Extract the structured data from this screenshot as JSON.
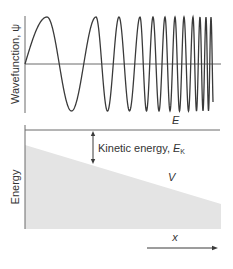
{
  "colors": {
    "line": "#3a3a3a",
    "axis": "#6a6a6a",
    "fill": "#e4e4e4",
    "text": "#333333",
    "background": "#ffffff"
  },
  "top_panel": {
    "ylabel": "Wavefunction, ψ",
    "axis": {
      "x": 25,
      "y_top": 16,
      "y_bottom": 113,
      "baseline_y": 64,
      "x_end": 221
    },
    "wave": {
      "x_start": 25,
      "x_end": 213,
      "amplitude": 47,
      "peaks_x": [
        47,
        96,
        119,
        140,
        153,
        165,
        175,
        184,
        193,
        200,
        206,
        211
      ]
    }
  },
  "bottom_panel": {
    "ylabel": "Energy",
    "axis": {
      "x": 25,
      "y_top": 125,
      "y_bottom": 229
    },
    "energy_line": {
      "label": "E",
      "y": 130,
      "x_start": 25,
      "x_end": 220,
      "label_x": 172,
      "label_y": 124
    },
    "potential": {
      "label": "V",
      "label_x": 168,
      "label_y": 181,
      "polygon": [
        [
          25,
          145
        ],
        [
          221,
          204
        ],
        [
          221,
          229
        ],
        [
          25,
          229
        ]
      ]
    },
    "kinetic_arrow": {
      "x": 93,
      "y_top": 131,
      "y_bottom": 164,
      "label": "Kinetic energy, ",
      "label_symbol": "E",
      "label_subscript": "K",
      "label_x": 98,
      "label_y": 152
    },
    "x_axis": {
      "label": "x",
      "label_x": 175,
      "label_y": 241,
      "arrow_x_start": 147,
      "arrow_x_end": 218,
      "arrow_y": 248
    }
  }
}
